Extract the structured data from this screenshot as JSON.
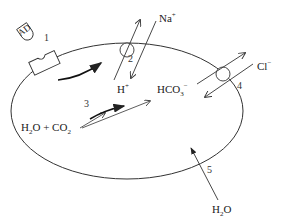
{
  "diagram": {
    "type": "cell transport schematic",
    "labels": {
      "enzyme_tag": "AD",
      "na": "Na",
      "na_charge": "+",
      "h": "H",
      "h_charge": "+",
      "hco3": "HCO",
      "hco3_sub": "3",
      "hco3_charge": "−",
      "cl": "Cl",
      "cl_charge": "−",
      "h2o_co2_a": "H",
      "h2o_co2_sub1": "2",
      "h2o_co2_b": "O + CO",
      "h2o_co2_sub2": "2",
      "water_a": "H",
      "water_sub": "2",
      "water_b": "O"
    },
    "numbers": [
      "1",
      "2",
      "3",
      "4",
      "5"
    ],
    "colors": {
      "stroke": "#333333",
      "text": "#222222",
      "background": "#ffffff"
    }
  }
}
